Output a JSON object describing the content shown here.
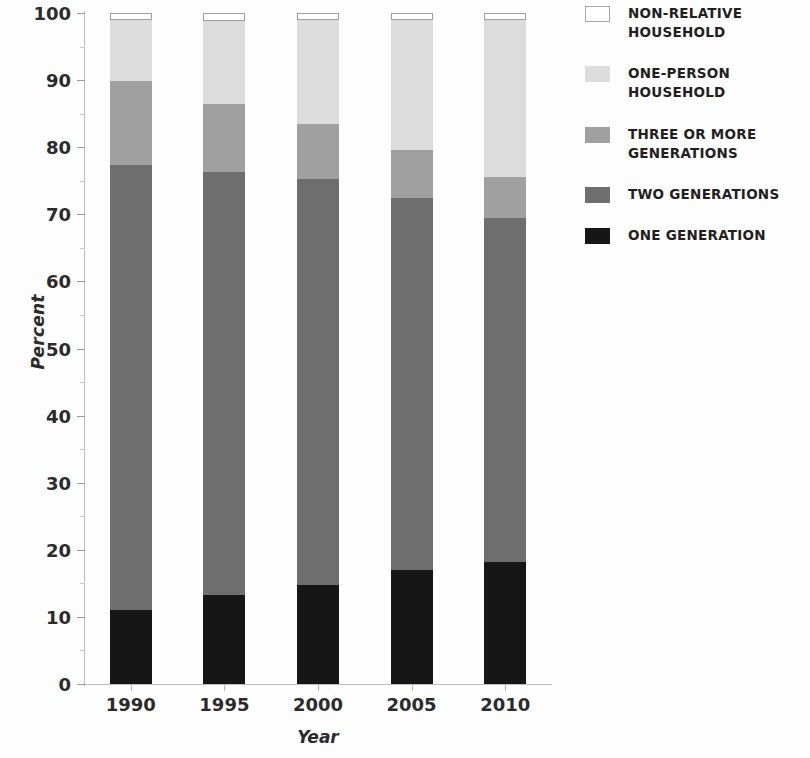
{
  "chart_data": {
    "type": "bar",
    "stacked": true,
    "title": "",
    "xlabel": "Year",
    "ylabel": "Percent",
    "categories": [
      "1990",
      "1995",
      "2000",
      "2005",
      "2010"
    ],
    "ylim": [
      0,
      100
    ],
    "yticks": [
      0,
      10,
      20,
      30,
      40,
      50,
      60,
      70,
      80,
      90,
      100
    ],
    "ytick_labels": [
      "0",
      "10",
      "20",
      "30",
      "40",
      "50",
      "60",
      "70",
      "80",
      "90",
      "100"
    ],
    "y_minor_ticks": [
      5,
      15,
      25,
      35,
      45,
      55,
      65,
      75,
      85,
      95
    ],
    "grid": false,
    "legend_position": "right",
    "series": [
      {
        "name": "ONE GENERATION",
        "color": "#161616",
        "values": [
          11.1,
          13.3,
          14.8,
          17.0,
          18.2
        ]
      },
      {
        "name": "TWO GENERATIONS",
        "color": "#6e6e6e",
        "values": [
          66.2,
          63.0,
          60.4,
          55.4,
          51.3
        ]
      },
      {
        "name": "THREE OR MORE GENERATIONS",
        "color": "#a0a0a0",
        "values": [
          12.6,
          10.1,
          8.3,
          7.2,
          6.1
        ]
      },
      {
        "name": "ONE-PERSON HOUSEHOLD",
        "color": "#dcdcdc",
        "values": [
          9.0,
          12.4,
          15.4,
          19.3,
          23.3
        ]
      },
      {
        "name": "NON-RELATIVE HOUSEHOLD",
        "color": "#ffffff",
        "values": [
          1.1,
          1.2,
          1.1,
          1.1,
          1.1
        ]
      }
    ]
  },
  "legend": {
    "items": [
      {
        "label": "NON-RELATIVE HOUSEHOLD",
        "swatch": "#ffffff",
        "outline": true
      },
      {
        "label": "ONE-PERSON HOUSEHOLD",
        "swatch": "#dcdcdc",
        "outline": false
      },
      {
        "label": "THREE OR MORE GENERATIONS",
        "swatch": "#a0a0a0",
        "outline": false
      },
      {
        "label": "TWO GENERATIONS",
        "swatch": "#6e6e6e",
        "outline": false
      },
      {
        "label": "ONE GENERATION",
        "swatch": "#161616",
        "outline": false
      }
    ]
  }
}
